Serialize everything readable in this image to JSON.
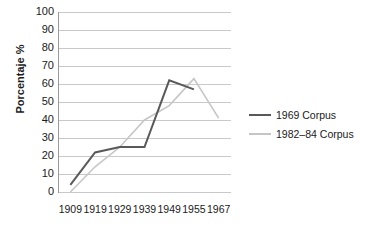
{
  "chart_data": {
    "type": "line",
    "title": "",
    "xlabel": "",
    "ylabel": "Porcentaje %",
    "x": [
      "1909",
      "1919",
      "1929",
      "1939",
      "1949",
      "1955",
      "1967"
    ],
    "categories": [
      "1909",
      "1919",
      "1929",
      "1939",
      "1949",
      "1955",
      "1967"
    ],
    "ylim": [
      0,
      100
    ],
    "yticks": [
      "100",
      "90",
      "80",
      "70",
      "60",
      "50",
      "40",
      "30",
      "20",
      "10",
      "0"
    ],
    "ytick_values": [
      100,
      90,
      80,
      70,
      60,
      50,
      40,
      30,
      20,
      10,
      0
    ],
    "grid": true,
    "legend_position": "right",
    "series": [
      {
        "name": "1969 Corpus",
        "color": "#595959",
        "values": [
          4,
          22,
          25,
          25,
          62,
          57,
          null
        ]
      },
      {
        "name": "1982–84 Corpus",
        "color": "#c6c6c6",
        "values": [
          0,
          14,
          25,
          40,
          48,
          63,
          41
        ]
      }
    ]
  },
  "legend": {
    "items": [
      {
        "label": "1969 Corpus",
        "color": "#595959"
      },
      {
        "label": "1982–84 Corpus",
        "color": "#c6c6c6"
      }
    ]
  },
  "axes": {
    "y_title": "Porcentaje %"
  }
}
